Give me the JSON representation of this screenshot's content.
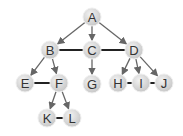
{
  "diagram": {
    "type": "tree",
    "colors": {
      "node_fill": "#d9d9d9",
      "node_stroke": "#eeeeee",
      "edge": "#666666",
      "sibling_edge": "#222222",
      "label": "#333333"
    },
    "nodes": [
      {
        "id": "A",
        "label": "A",
        "x": 92,
        "y": 17
      },
      {
        "id": "B",
        "label": "B",
        "x": 50,
        "y": 50
      },
      {
        "id": "C",
        "label": "C",
        "x": 92,
        "y": 50
      },
      {
        "id": "D",
        "label": "D",
        "x": 134,
        "y": 50
      },
      {
        "id": "E",
        "label": "E",
        "x": 25,
        "y": 83
      },
      {
        "id": "F",
        "label": "F",
        "x": 59,
        "y": 83
      },
      {
        "id": "G",
        "label": "G",
        "x": 92,
        "y": 84
      },
      {
        "id": "H",
        "label": "H",
        "x": 118,
        "y": 83
      },
      {
        "id": "I",
        "label": "I",
        "x": 141,
        "y": 83
      },
      {
        "id": "J",
        "label": "J",
        "x": 164,
        "y": 83
      },
      {
        "id": "K",
        "label": "K",
        "x": 47,
        "y": 118
      },
      {
        "id": "L",
        "label": "L",
        "x": 72,
        "y": 118
      }
    ],
    "arrows": [
      [
        "A",
        "B"
      ],
      [
        "A",
        "C"
      ],
      [
        "A",
        "D"
      ],
      [
        "B",
        "E"
      ],
      [
        "B",
        "F"
      ],
      [
        "C",
        "G"
      ],
      [
        "D",
        "H"
      ],
      [
        "D",
        "I"
      ],
      [
        "D",
        "J"
      ],
      [
        "F",
        "K"
      ],
      [
        "F",
        "L"
      ]
    ],
    "sibling_links": [
      [
        "B",
        "C"
      ],
      [
        "C",
        "D"
      ],
      [
        "E",
        "F"
      ],
      [
        "H",
        "I"
      ],
      [
        "I",
        "J"
      ],
      [
        "K",
        "L"
      ]
    ]
  }
}
